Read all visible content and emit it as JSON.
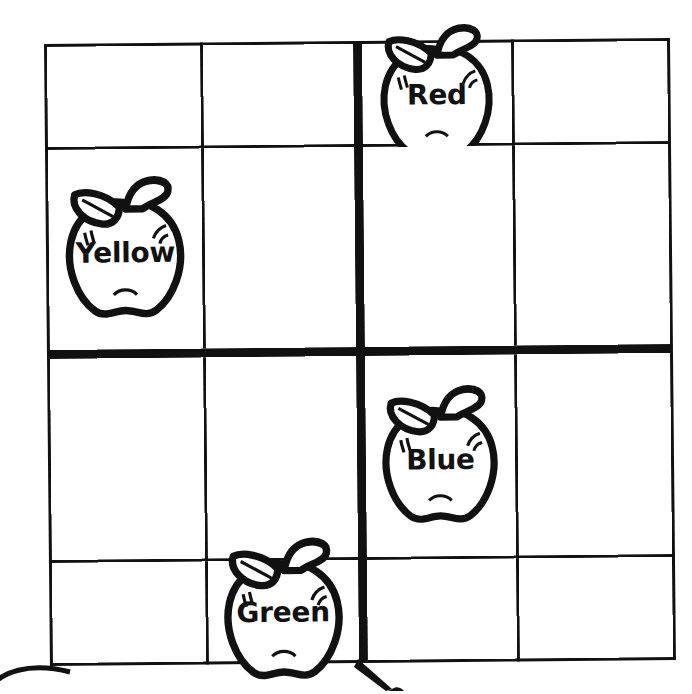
{
  "worksheet": {
    "title": "Color words apple grid",
    "ink_color": "#111111",
    "paper_color": "#ffffff",
    "grid": {
      "rows": 4,
      "columns": 4,
      "thick_divider_after_column": 2,
      "thick_divider_after_row": 2,
      "cells": [
        [
          {
            "row": 1,
            "col": 1,
            "apple": false,
            "label": ""
          },
          {
            "row": 1,
            "col": 2,
            "apple": false,
            "label": ""
          },
          {
            "row": 1,
            "col": 3,
            "apple": true,
            "label": "Red"
          },
          {
            "row": 1,
            "col": 4,
            "apple": false,
            "label": ""
          }
        ],
        [
          {
            "row": 2,
            "col": 1,
            "apple": true,
            "label": "Yellow"
          },
          {
            "row": 2,
            "col": 2,
            "apple": false,
            "label": ""
          },
          {
            "row": 2,
            "col": 3,
            "apple": false,
            "label": ""
          },
          {
            "row": 2,
            "col": 4,
            "apple": false,
            "label": ""
          }
        ],
        [
          {
            "row": 3,
            "col": 1,
            "apple": false,
            "label": ""
          },
          {
            "row": 3,
            "col": 2,
            "apple": false,
            "label": ""
          },
          {
            "row": 3,
            "col": 3,
            "apple": true,
            "label": "Blue"
          },
          {
            "row": 3,
            "col": 4,
            "apple": false,
            "label": ""
          }
        ],
        [
          {
            "row": 4,
            "col": 1,
            "apple": false,
            "label": ""
          },
          {
            "row": 4,
            "col": 2,
            "apple": true,
            "label": "Green"
          },
          {
            "row": 4,
            "col": 3,
            "apple": false,
            "label": ""
          },
          {
            "row": 4,
            "col": 4,
            "apple": false,
            "label": ""
          }
        ]
      ]
    },
    "labels": {
      "red": "Red",
      "yellow": "Yellow",
      "blue": "Blue",
      "green": "Green"
    },
    "icon_names": {
      "apple": "apple-outline-icon",
      "arc": "partial-arc-mark-icon",
      "point": "partial-pointer-mark-icon"
    }
  }
}
